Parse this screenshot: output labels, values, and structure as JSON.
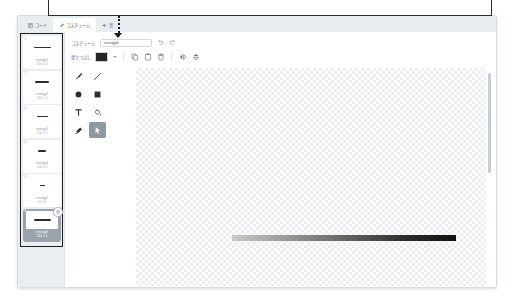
{
  "annotation": {
    "note": ""
  },
  "tabs": [
    {
      "label": "コード",
      "icon": "code-icon",
      "active": false
    },
    {
      "label": "コスチューム",
      "icon": "brush-icon",
      "active": true
    },
    {
      "label": "音",
      "icon": "sound-icon",
      "active": false
    }
  ],
  "costume_list": {
    "items": [
      {
        "number": "1",
        "name": "energy1",
        "size": "250 x 4",
        "line_width": 17
      },
      {
        "number": "2",
        "name": "energy2",
        "size": "200 x 4",
        "line_width": 14
      },
      {
        "number": "3",
        "name": "energy3",
        "size": "150 x 4",
        "line_width": 11
      },
      {
        "number": "4",
        "name": "energy4",
        "size": "100 x 4",
        "line_width": 8
      },
      {
        "number": "5",
        "name": "energy5",
        "size": "50 x 4",
        "line_width": 5
      },
      {
        "number": "6",
        "name": "energy6",
        "size": "250 x 4",
        "line_width": 17,
        "selected": true
      }
    ],
    "delete_badge_icon": "trash-icon"
  },
  "editor": {
    "name_row": {
      "label": "コスチューム",
      "value": "energy6",
      "placeholder": "コスチューム名",
      "undo_icon": "undo-icon",
      "redo_icon": "redo-icon"
    },
    "options_row": {
      "fill_label": "塗りつぶし",
      "fill_color": "#262626",
      "buttons": [
        {
          "name": "copy-button",
          "icon": "copy-icon"
        },
        {
          "name": "paste-button",
          "icon": "paste-icon"
        },
        {
          "name": "delete-button",
          "icon": "trash-icon"
        },
        {
          "name": "flip-horizontal-button",
          "icon": "flip-horizontal-icon"
        },
        {
          "name": "flip-vertical-button",
          "icon": "flip-vertical-icon"
        }
      ]
    },
    "tools": [
      {
        "name": "brush-tool",
        "icon": "brush-icon",
        "active": false
      },
      {
        "name": "line-tool",
        "icon": "line-icon",
        "active": false
      },
      {
        "name": "circle-tool",
        "icon": "circle-icon",
        "active": false
      },
      {
        "name": "rect-tool",
        "icon": "square-icon",
        "active": false
      },
      {
        "name": "text-tool",
        "icon": "text-icon",
        "active": false
      },
      {
        "name": "fill-tool",
        "icon": "paint-bucket-icon",
        "active": false
      },
      {
        "name": "eraser-tool",
        "icon": "eraser-icon",
        "active": false
      },
      {
        "name": "select-tool",
        "icon": "arrow-select-icon",
        "active": true
      }
    ],
    "canvas": {
      "background": "transparent-checkerboard",
      "artwork": {
        "shape": "horizontal-gradient-bar",
        "gradient_from": "#c9c9c9",
        "gradient_to": "#111111"
      }
    }
  },
  "colors": {
    "window_bg": "#ffffff",
    "tabbar_bg": "#e8edf1",
    "rail_bg": "#e9eef2",
    "selected_item_bg": "#9aa2ab",
    "active_tool_bg": "#8f979f",
    "outline": "#1d1d1d"
  }
}
